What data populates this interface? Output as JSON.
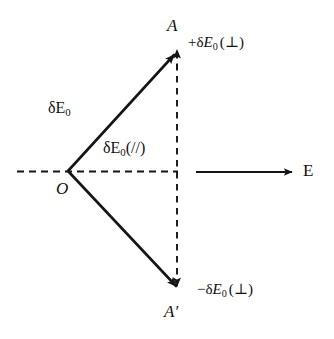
{
  "figure": {
    "background_color": "#ffffff",
    "stroke_color": "#151515",
    "type": "vector-decomposition-diagram"
  },
  "labels": {
    "point_a": "A",
    "point_a_prime": "A′",
    "origin": "O",
    "field_axis": "E",
    "magnitude_delta": "δ",
    "magnitude_e_upright": "E",
    "subscript_zero": "0",
    "parallel_suffix": "(//)",
    "perp_suffix": "(⊥)",
    "plus_sign": "+",
    "minus_sign": "−",
    "delta_e0_full": "δE₀",
    "delta_e0_parallel_full": "δE₀(//)",
    "plus_delta_e0_perp_full": "+δE₀(⊥)",
    "minus_delta_e0_perp_full": "−δE₀(⊥)"
  },
  "geometry": {
    "origin": {
      "x": 68,
      "y": 171
    },
    "point_a": {
      "x": 178,
      "y": 50
    },
    "point_a_prime": {
      "x": 180,
      "y": 291
    },
    "axis_dashed": {
      "x1": 17,
      "y1": 171,
      "x2": 178,
      "y2": 171
    },
    "vertical_dashed": {
      "x": 177,
      "y_top": 50,
      "y_bottom": 290
    },
    "field_arrow": {
      "x1": 196,
      "y1": 172,
      "x2": 296,
      "y2": 172
    }
  }
}
